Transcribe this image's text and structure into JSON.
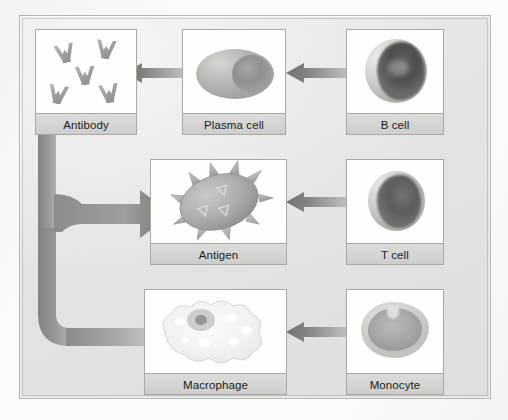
{
  "diagram": {
    "frame": {
      "border_color": "#b4b4b2",
      "background_color": "#e6e6e4"
    },
    "arrow_color_head": "#6f6f6c",
    "arrow_color_tail": "#bdbdba",
    "cards": [
      {
        "id": "antibody",
        "label": "Antibody",
        "art": "antibody-cluster-icon",
        "row": "top",
        "column": "left"
      },
      {
        "id": "plasma-cell",
        "label": "Plasma cell",
        "art": "plasma-cell-icon",
        "row": "top",
        "column": "middle"
      },
      {
        "id": "b-cell",
        "label": "B cell",
        "art": "b-cell-icon",
        "row": "top",
        "column": "right"
      },
      {
        "id": "antigen",
        "label": "Antigen",
        "art": "antigen-spiky-icon",
        "row": "middle",
        "column": "middle"
      },
      {
        "id": "t-cell",
        "label": "T cell",
        "art": "t-cell-icon",
        "row": "middle",
        "column": "right"
      },
      {
        "id": "macrophage",
        "label": "Macrophage",
        "art": "macrophage-icon",
        "row": "bottom",
        "column": "middle"
      },
      {
        "id": "monocyte",
        "label": "Monocyte",
        "art": "monocyte-icon",
        "row": "bottom",
        "column": "right"
      }
    ],
    "arrows": [
      {
        "id": "b-cell-to-plasma-cell",
        "from": "B cell",
        "to": "Plasma cell",
        "direction": "left"
      },
      {
        "id": "plasma-cell-to-antibody",
        "from": "Plasma cell",
        "to": "Antibody",
        "direction": "left"
      },
      {
        "id": "t-cell-to-antigen",
        "from": "T cell",
        "to": "Antigen",
        "direction": "left"
      },
      {
        "id": "monocyte-to-macrophage",
        "from": "Monocyte",
        "to": "Macrophage",
        "direction": "left"
      },
      {
        "id": "antibody-to-antigen-and-macrophage",
        "from": "Antibody",
        "to": "Antigen, Macrophage",
        "direction": "forked"
      }
    ],
    "antibody_glyph_count": 5
  }
}
